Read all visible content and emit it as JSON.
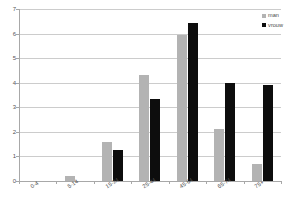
{
  "chart_data": {
    "type": "bar",
    "title": "",
    "xlabel": "",
    "ylabel": "",
    "categories": [
      "0-4",
      "5-14",
      "15-24",
      "25-44",
      "45-64",
      "65-74",
      "75+"
    ],
    "series": [
      {
        "name": "man",
        "color": "#b3b3b3",
        "values": [
          0,
          0.2,
          1.6,
          4.3,
          5.95,
          2.1,
          0.7
        ]
      },
      {
        "name": "vrouw",
        "color": "#0d0d0d",
        "values": [
          0,
          0,
          1.25,
          3.35,
          6.45,
          4.0,
          3.9
        ]
      }
    ],
    "ylim": [
      0,
      7
    ],
    "yticks": [
      0,
      1,
      2,
      3,
      4,
      5,
      6,
      7
    ],
    "ytick_labels": [
      "0",
      "1",
      "2",
      "3",
      "4",
      "5",
      "6",
      "7"
    ],
    "grid": true,
    "legend_position": "top-right",
    "legend_entries": [
      "man",
      "vrouw"
    ],
    "colors": {
      "man": "#b3b3b3",
      "vrouw": "#0d0d0d",
      "gridline": "#cccccc",
      "axis": "#a8a8a8",
      "text": "#4a4a4a"
    }
  }
}
